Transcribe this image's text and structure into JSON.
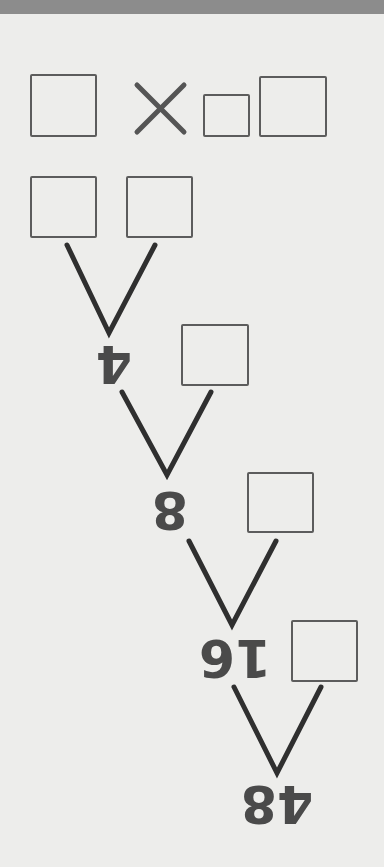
{
  "diagram": {
    "type": "factor-tree",
    "orientation_note": "numbers rendered upside down",
    "equation_row": {
      "operator": "×",
      "boxes": 3
    },
    "levels": [
      {
        "value": "4",
        "pair_boxes": 2,
        "side_box": 1
      },
      {
        "value": "8",
        "side_box": 1
      },
      {
        "value": "16",
        "side_box": 1
      },
      {
        "value": "48"
      }
    ]
  },
  "colors": {
    "background": "#ededeb",
    "top_bar": "#8c8c8c",
    "box_border": "#5c5c5c",
    "branch_line": "#2f2f2f",
    "number": "#4a4a4a",
    "operator": "#555555"
  }
}
